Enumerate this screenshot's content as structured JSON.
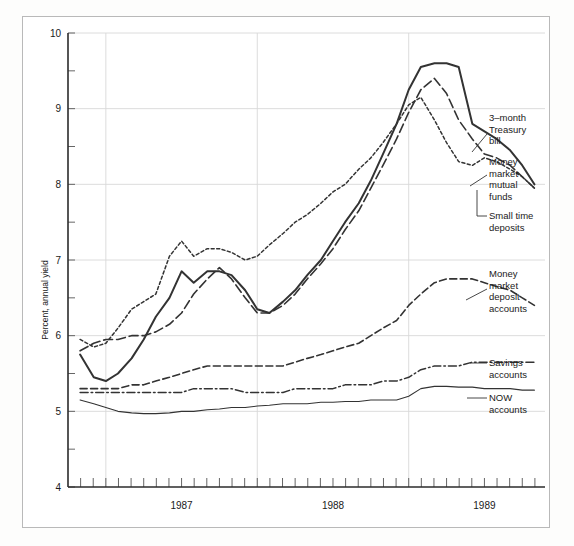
{
  "chart_data": {
    "type": "line",
    "title": "",
    "xlabel": "",
    "ylabel": "Percent, annual yield",
    "ylim": [
      4,
      10
    ],
    "xlim": [
      1986.75,
      1989.9
    ],
    "y_ticks": [
      4,
      5,
      6,
      7,
      8,
      9,
      10
    ],
    "y_tick_labels": [
      "4",
      "5",
      "6",
      "7",
      "8",
      "9",
      "10"
    ],
    "y_minor_ticks": [
      4.5,
      5.5,
      6.5,
      7.5,
      8.5,
      9.5
    ],
    "x_tick_labels": [
      "1987",
      "1988",
      "1989"
    ],
    "x_tick_positions": [
      1987.5,
      1988.5,
      1989.5
    ],
    "x_gridlines": [
      1987.0,
      1988.0,
      1989.0
    ],
    "x_minor_tick_interval": "monthly",
    "grid": true,
    "legend_position": "right-inline-annotations",
    "x": [
      1986.83,
      1986.92,
      1987.0,
      1987.08,
      1987.17,
      1987.25,
      1987.33,
      1987.42,
      1987.5,
      1987.58,
      1987.67,
      1987.75,
      1987.83,
      1987.92,
      1988.0,
      1988.08,
      1988.17,
      1988.25,
      1988.33,
      1988.42,
      1988.5,
      1988.58,
      1988.67,
      1988.75,
      1988.83,
      1988.92,
      1989.0,
      1989.08,
      1989.17,
      1989.25,
      1989.33,
      1989.42,
      1989.5,
      1989.58,
      1989.67,
      1989.75,
      1989.83
    ],
    "series": [
      {
        "name": "3-month Treasury bill",
        "style": "dotted",
        "values": [
          5.95,
          5.85,
          5.9,
          6.1,
          6.35,
          6.45,
          6.55,
          7.05,
          7.25,
          7.05,
          7.15,
          7.15,
          7.1,
          7.0,
          7.05,
          7.2,
          7.35,
          7.5,
          7.6,
          7.75,
          7.9,
          8.0,
          8.2,
          8.35,
          8.55,
          8.8,
          9.05,
          9.15,
          8.85,
          8.55,
          8.3,
          8.25,
          8.35,
          8.3,
          8.2,
          8.1,
          7.95
        ]
      },
      {
        "name": "Money market mutual funds",
        "style": "solid-thick",
        "values": [
          5.75,
          5.45,
          5.4,
          5.5,
          5.7,
          5.95,
          6.25,
          6.5,
          6.85,
          6.7,
          6.85,
          6.85,
          6.8,
          6.6,
          6.35,
          6.3,
          6.45,
          6.6,
          6.8,
          7.0,
          7.25,
          7.5,
          7.75,
          8.05,
          8.4,
          8.8,
          9.25,
          9.55,
          9.6,
          9.6,
          9.55,
          8.8,
          8.7,
          8.6,
          8.45,
          8.25,
          8.0
        ]
      },
      {
        "name": "Small time deposits",
        "style": "dashed-long",
        "values": [
          5.8,
          5.9,
          5.95,
          5.95,
          6.0,
          6.0,
          6.05,
          6.15,
          6.3,
          6.55,
          6.75,
          6.9,
          6.75,
          6.5,
          6.3,
          6.3,
          6.4,
          6.55,
          6.75,
          6.95,
          7.15,
          7.4,
          7.65,
          7.95,
          8.25,
          8.6,
          8.95,
          9.25,
          9.4,
          9.2,
          8.85,
          8.6,
          8.4,
          8.35,
          8.25,
          8.1,
          7.95
        ]
      },
      {
        "name": "Money market deposit accounts",
        "style": "dashed-medium",
        "values": [
          5.3,
          5.3,
          5.3,
          5.3,
          5.35,
          5.35,
          5.4,
          5.45,
          5.5,
          5.55,
          5.6,
          5.6,
          5.6,
          5.6,
          5.6,
          5.6,
          5.6,
          5.65,
          5.7,
          5.75,
          5.8,
          5.85,
          5.9,
          6.0,
          6.1,
          6.2,
          6.4,
          6.55,
          6.7,
          6.75,
          6.75,
          6.75,
          6.7,
          6.65,
          6.6,
          6.5,
          6.4
        ]
      },
      {
        "name": "Savings accounts",
        "style": "dash-dot",
        "values": [
          5.25,
          5.25,
          5.25,
          5.25,
          5.25,
          5.25,
          5.25,
          5.25,
          5.25,
          5.3,
          5.3,
          5.3,
          5.3,
          5.25,
          5.25,
          5.25,
          5.25,
          5.3,
          5.3,
          5.3,
          5.3,
          5.35,
          5.35,
          5.35,
          5.4,
          5.4,
          5.45,
          5.55,
          5.6,
          5.6,
          5.6,
          5.65,
          5.65,
          5.65,
          5.65,
          5.65,
          5.65
        ]
      },
      {
        "name": "NOW accounts",
        "style": "solid-thin",
        "values": [
          5.15,
          5.1,
          5.05,
          5.0,
          4.98,
          4.97,
          4.97,
          4.98,
          5.0,
          5.0,
          5.02,
          5.03,
          5.05,
          5.05,
          5.07,
          5.08,
          5.1,
          5.1,
          5.1,
          5.12,
          5.12,
          5.13,
          5.13,
          5.15,
          5.15,
          5.15,
          5.2,
          5.3,
          5.33,
          5.33,
          5.32,
          5.32,
          5.3,
          5.3,
          5.3,
          5.28,
          5.28
        ]
      }
    ],
    "annotations": [
      {
        "id": "treasury-bill",
        "lines": [
          "3–month",
          "Treasury",
          "bill"
        ]
      },
      {
        "id": "mm-mutual-funds",
        "lines": [
          "Money",
          "market",
          "mutual",
          "funds"
        ]
      },
      {
        "id": "small-time-deposits",
        "lines": [
          "Small time",
          "deposits"
        ]
      },
      {
        "id": "mm-deposit-accounts",
        "lines": [
          "Money",
          "market",
          "deposit",
          "accounts"
        ]
      },
      {
        "id": "savings-accounts",
        "lines": [
          "Savings",
          "accounts"
        ]
      },
      {
        "id": "now-accounts",
        "lines": [
          "NOW",
          "accounts"
        ]
      }
    ]
  }
}
